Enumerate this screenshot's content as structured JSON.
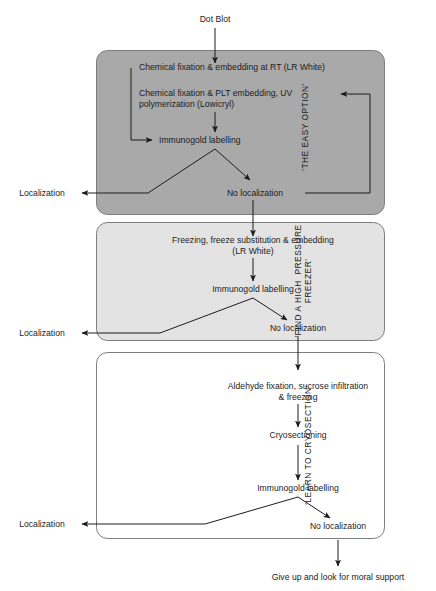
{
  "diagram": {
    "entry_label": "Dot Blot",
    "final_label": "Give up and look for moral support",
    "colors": {
      "box1_fill": "#a9a9a9",
      "box2_fill": "#e3e3e3",
      "box3_fill": "#ffffff",
      "stroke": "#808080",
      "arrow": "#1c1c1c",
      "text": "#1c1c1c",
      "page_background": "#ffffff"
    },
    "sections": [
      {
        "id": "easy-option",
        "side_label": "'THE EASY OPTION'",
        "fill": "#a9a9a9",
        "steps": [
          "Chemical fixation & embedding at RT (LR White)",
          "Chemical fixation & PLT embedding, UV\npolymerization (Lowicryl)",
          "Immunogold labelling"
        ],
        "outcome_positive": "Localization",
        "outcome_negative": "No localization"
      },
      {
        "id": "high-pressure-freezer",
        "side_label": "'FIND A HIGH  PRESSURE\nFREEZER'",
        "fill": "#e3e3e3",
        "steps": [
          "Freezing, freeze substitution & embedding\n(LR White)",
          "Immunogold labelling"
        ],
        "outcome_positive": "Localization",
        "outcome_negative": "No localization"
      },
      {
        "id": "learn-to-cryosection",
        "side_label": "'LEARN TO CRYOSECTION'",
        "fill": "#ffffff",
        "steps": [
          "Aldehyde fixation, sucrose infiltration\n& freezing",
          "Cryosectioning",
          "Immunogold labelling"
        ],
        "outcome_positive": "Localization",
        "outcome_negative": "No localization"
      }
    ]
  }
}
